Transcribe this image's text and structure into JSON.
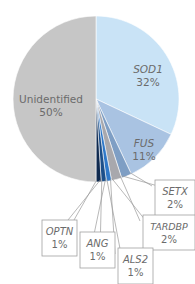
{
  "chart_data": {
    "type": "pie",
    "title": "",
    "start_angle_deg": 0,
    "direction": "clockwise",
    "slices": [
      {
        "label": "SOD1",
        "value": 32,
        "display": "32%",
        "color": "#c9e3f6",
        "italic": true
      },
      {
        "label": "FUS",
        "value": 11,
        "display": "11%",
        "color": "#a9c3e2",
        "italic": true
      },
      {
        "label": "SETX",
        "value": 2,
        "display": "2%",
        "color": "#7e9ec4",
        "italic": true
      },
      {
        "label": "TARDBP",
        "value": 2,
        "display": "2%",
        "color": "#a8a8ad",
        "italic": true
      },
      {
        "label": "ALS2",
        "value": 1,
        "display": "1%",
        "color": "#2f78c8",
        "italic": true
      },
      {
        "label": "ANG",
        "value": 1,
        "display": "1%",
        "color": "#1c4f8a",
        "italic": true
      },
      {
        "label": "OPTN",
        "value": 1,
        "display": "1%",
        "color": "#0f2a4f",
        "italic": true
      },
      {
        "label": "Unidentified",
        "value": 50,
        "display": "50%",
        "color": "#c6c6c6",
        "italic": false
      }
    ],
    "callouts": [
      {
        "label": "SETX",
        "box": [
          155,
          180,
          40,
          36
        ]
      },
      {
        "label": "TARDBP",
        "box": [
          143,
          215,
          52,
          35
        ]
      },
      {
        "label": "ALS2",
        "box": [
          118,
          248,
          35,
          36
        ]
      },
      {
        "label": "ANG",
        "box": [
          80,
          232,
          35,
          36
        ]
      },
      {
        "label": "OPTN",
        "box": [
          42,
          220,
          35,
          36
        ]
      }
    ],
    "legend": "none",
    "grid": false
  }
}
